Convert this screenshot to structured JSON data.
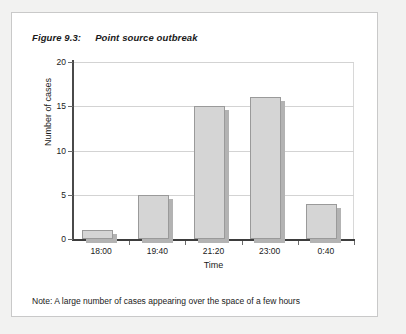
{
  "figure": {
    "number": "Figure 9.3:",
    "caption": "Point source outbreak",
    "note": "Note: A large number of cases appearing over the space of a few hours"
  },
  "chart_data": {
    "type": "bar",
    "title": "Point source outbreak",
    "categories": [
      "18:00",
      "19:40",
      "21:20",
      "23:00",
      "0:40"
    ],
    "values": [
      1,
      5,
      15,
      16,
      4
    ],
    "xlabel": "Time",
    "ylabel": "Number of cases",
    "ylim": [
      0,
      20
    ],
    "yticks": [
      0,
      5,
      10,
      15,
      20
    ],
    "ytick_labels": [
      "0",
      "5",
      "10",
      "15",
      "20"
    ],
    "grid": "horizontal",
    "legend": "none",
    "bar_fill": "#d5d5d5",
    "bar_edge": "#9a9a9a",
    "bar_shadow": "#b3b3b3"
  }
}
